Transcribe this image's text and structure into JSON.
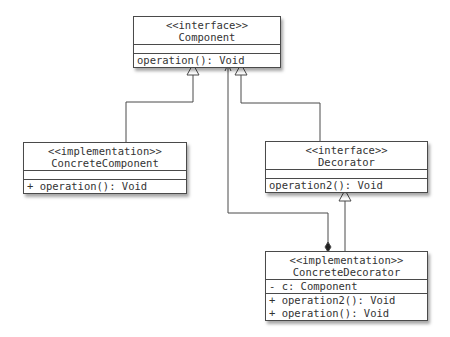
{
  "diagram": {
    "type": "UML class diagram",
    "classes": [
      {
        "id": "component",
        "stereotype": "<<interface>>",
        "name": "Component",
        "attributes": [],
        "operations": [
          "operation(): Void"
        ]
      },
      {
        "id": "concrete_component",
        "stereotype": "<<implementation>>",
        "name": "ConcreteComponent",
        "attributes": [],
        "operations": [
          "+ operation(): Void"
        ]
      },
      {
        "id": "decorator",
        "stereotype": "<<interface>>",
        "name": "Decorator",
        "attributes": [],
        "operations": [
          "operation2(): Void"
        ]
      },
      {
        "id": "concrete_decorator",
        "stereotype": "<<implementation>>",
        "name": "ConcreteDecorator",
        "attributes": [
          "- c: Component"
        ],
        "operations": [
          "+ operation2(): Void",
          "+ operation(): Void"
        ]
      }
    ],
    "relationships": [
      {
        "from": "ConcreteComponent",
        "to": "Component",
        "type": "realization-generalization",
        "arrow": "hollow-triangle"
      },
      {
        "from": "Decorator",
        "to": "Component",
        "type": "generalization",
        "arrow": "hollow-triangle"
      },
      {
        "from": "ConcreteDecorator",
        "to": "Decorator",
        "type": "realization-generalization",
        "arrow": "hollow-triangle"
      },
      {
        "from": "ConcreteDecorator",
        "to": "Component",
        "type": "composition-navigable",
        "arrow": "open-arrow",
        "source_end": "filled-diamond"
      }
    ],
    "colors": {
      "line": "#4a4a4a",
      "text": "#333333",
      "background": "#ffffff"
    }
  }
}
